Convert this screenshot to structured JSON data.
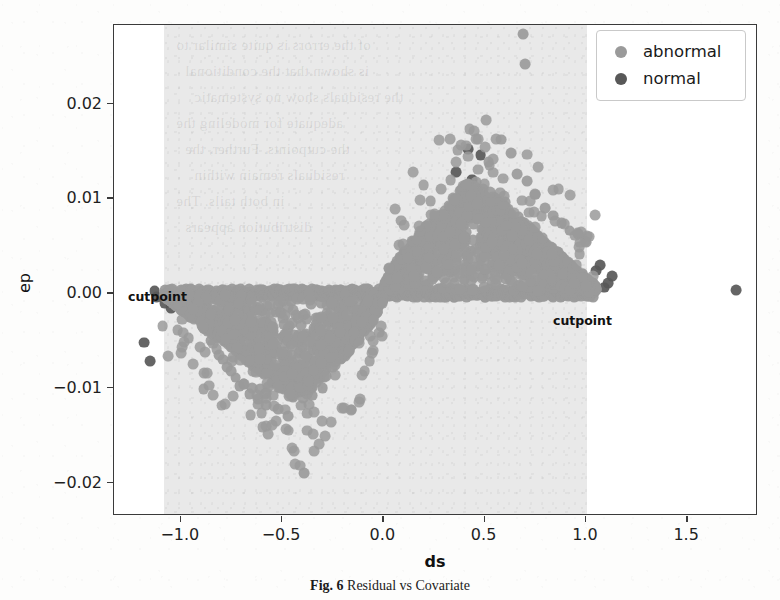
{
  "figure": {
    "caption_prefix": "Fig. 6",
    "caption_text": "Residual vs Covariate",
    "xlabel": "ds",
    "ylabel": "ep"
  },
  "legend": {
    "position": "upper-right",
    "entries": [
      {
        "label": "abnormal",
        "color": "#9a9a9a"
      },
      {
        "label": "normal",
        "color": "#585858"
      }
    ]
  },
  "annotations": [
    {
      "name": "cutpoint-left",
      "text": "cutpoint",
      "x": -1.06,
      "y": 0.0
    },
    {
      "name": "cutpoint-right",
      "text": "cutpoint",
      "x": 1.04,
      "y": -0.0005
    }
  ],
  "chart_data": {
    "type": "scatter",
    "title": "",
    "xlabel": "ds",
    "ylabel": "ep",
    "xlim": [
      -1.33,
      1.85
    ],
    "ylim": [
      -0.0235,
      0.0283
    ],
    "xticks": [
      -1.0,
      -0.5,
      0.0,
      0.5,
      1.0,
      1.5
    ],
    "xticklabels": [
      "-1.0",
      "-0.5",
      "0.0",
      "0.5",
      "1.0",
      "1.5"
    ],
    "yticks": [
      0.02,
      0.01,
      0.0,
      -0.01,
      -0.02
    ],
    "yticklabels": [
      "0.02",
      "0.01",
      "0.00",
      "-0.01",
      "-0.02"
    ],
    "grid": false,
    "shaded_region": {
      "x_start": -1.085,
      "x_end": 1.005,
      "color": "#e9e9e9",
      "label": "cutpoint band"
    },
    "series": [
      {
        "name": "abnormal",
        "color": "#9a9a9a",
        "marker": "o",
        "points": [
          [
            0.69,
            0.0273
          ],
          [
            0.7,
            0.0242
          ],
          [
            0.58,
            0.0162
          ],
          [
            0.63,
            0.0148
          ],
          [
            0.52,
            0.0138
          ],
          [
            0.71,
            0.0118
          ],
          [
            0.66,
            0.0126
          ],
          [
            0.75,
            0.0104
          ],
          [
            0.47,
            0.0105
          ],
          [
            0.55,
            0.01
          ],
          [
            0.6,
            0.0096
          ],
          [
            0.8,
            0.009
          ],
          [
            0.84,
            0.0082
          ],
          [
            0.88,
            0.0074
          ],
          [
            0.92,
            0.0066
          ],
          [
            0.96,
            0.0062
          ],
          [
            1.0,
            0.0054
          ],
          [
            0.44,
            0.0092
          ],
          [
            0.41,
            0.0086
          ],
          [
            0.38,
            0.008
          ],
          [
            0.35,
            0.0072
          ],
          [
            0.32,
            0.0065
          ],
          [
            0.29,
            0.0058
          ],
          [
            0.26,
            0.005
          ],
          [
            0.23,
            0.0043
          ],
          [
            0.2,
            0.0036
          ],
          [
            0.17,
            0.0029
          ],
          [
            0.14,
            0.0022
          ],
          [
            0.11,
            0.0015
          ],
          [
            0.08,
            0.001
          ],
          [
            0.05,
            0.0005
          ],
          [
            0.02,
            0.0002
          ],
          [
            0.5,
            0.0078
          ],
          [
            0.53,
            0.007
          ],
          [
            0.57,
            0.0064
          ],
          [
            0.61,
            0.0056
          ],
          [
            0.65,
            0.005
          ],
          [
            0.69,
            0.0044
          ],
          [
            0.73,
            0.0038
          ],
          [
            0.77,
            0.0032
          ],
          [
            0.81,
            0.0026
          ],
          [
            0.85,
            0.002
          ],
          [
            0.89,
            0.0014
          ],
          [
            0.93,
            0.0009
          ],
          [
            0.97,
            0.0005
          ],
          [
            1.01,
            0.0002
          ],
          [
            -0.05,
            -0.0005
          ],
          [
            -0.09,
            -0.0012
          ],
          [
            -0.13,
            -0.002
          ],
          [
            -0.17,
            -0.0028
          ],
          [
            -0.21,
            -0.0036
          ],
          [
            -0.25,
            -0.0044
          ],
          [
            -0.29,
            -0.0052
          ],
          [
            -0.33,
            -0.006
          ],
          [
            -0.37,
            -0.0068
          ],
          [
            -0.41,
            -0.0076
          ],
          [
            -0.45,
            -0.0084
          ],
          [
            -0.49,
            -0.009
          ],
          [
            -0.53,
            -0.0095
          ],
          [
            -0.57,
            -0.0099
          ],
          [
            -0.61,
            -0.0101
          ],
          [
            -0.65,
            -0.01
          ],
          [
            -0.69,
            -0.0096
          ],
          [
            -0.73,
            -0.0089
          ],
          [
            -0.77,
            -0.0078
          ],
          [
            -0.81,
            -0.0065
          ],
          [
            -0.85,
            -0.005
          ],
          [
            -0.89,
            -0.0036
          ],
          [
            -0.93,
            -0.0024
          ],
          [
            -0.97,
            -0.0014
          ],
          [
            -1.01,
            -0.0007
          ],
          [
            -1.04,
            -0.0003
          ],
          [
            -0.39,
            -0.019
          ],
          [
            -0.47,
            -0.013
          ],
          [
            -0.52,
            -0.0122
          ],
          [
            -0.58,
            -0.0118
          ],
          [
            -0.62,
            -0.0112
          ],
          [
            -0.35,
            -0.0108
          ],
          [
            -0.3,
            -0.01
          ],
          [
            -0.66,
            -0.0106
          ],
          [
            -0.71,
            -0.0098
          ],
          [
            -0.75,
            -0.0082
          ],
          [
            -0.79,
            -0.007
          ]
        ]
      },
      {
        "name": "normal",
        "color": "#585858",
        "marker": "o",
        "points": [
          [
            1.74,
            0.0003
          ],
          [
            1.11,
            0.0011
          ],
          [
            1.09,
            0.0006
          ],
          [
            1.13,
            0.0018
          ],
          [
            1.05,
            0.0024
          ],
          [
            1.07,
            0.003
          ],
          [
            -1.13,
            0.0002
          ],
          [
            -1.12,
            -0.0004
          ],
          [
            -1.18,
            -0.0052
          ],
          [
            -1.15,
            -0.0072
          ],
          [
            -1.08,
            -0.001
          ],
          [
            -1.05,
            -0.0016
          ],
          [
            0.42,
            0.0152
          ],
          [
            0.48,
            0.0146
          ],
          [
            0.36,
            0.0128
          ],
          [
            0.44,
            0.012
          ]
        ]
      }
    ]
  },
  "bleed_text": [
    "of the errors is quite similar to",
    "is shown that the conditional",
    "the residuals show no systematic",
    "adequate for modeling the",
    "the cutpoints. Further, the",
    "residuals remain within",
    "in both tails. The",
    "distribution appears"
  ]
}
